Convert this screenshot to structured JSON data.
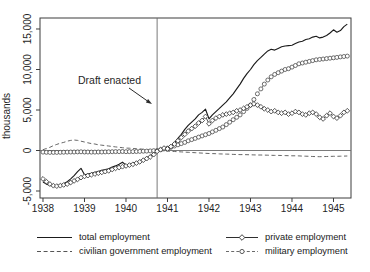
{
  "chart_data": {
    "type": "line",
    "title": "",
    "ylabel": "thousands",
    "xlabel": "",
    "frequency": "monthly",
    "x_start": 1938.0,
    "x_end": 1945.333,
    "x_ticks": [
      "1938",
      "1939",
      "1940",
      "1941",
      "1942",
      "1943",
      "1944",
      "1945"
    ],
    "x_tick_values": [
      1938,
      1939,
      1940,
      1941,
      1942,
      1943,
      1944,
      1945
    ],
    "y_ticks": [
      -5000,
      0,
      5000,
      10000,
      15000
    ],
    "y_tick_labels": [
      "-5,000",
      "0",
      "5,000",
      "10,000",
      "15,000"
    ],
    "xlim": [
      1937.928,
      1945.422
    ],
    "ylim": [
      -5864,
      16358
    ],
    "grid": "off",
    "zero_line_y": 0,
    "ref_line_x": 1940.75,
    "annotation": {
      "text": "Draft enacted",
      "points_to": "vertical reference line at draft enactment (late 1940)",
      "arrow_tip_x": 1940.63,
      "arrow_tip_y": 5740
    },
    "legend_position": "bottom, two columns",
    "series": [
      {
        "name": "total employment",
        "line": "solid",
        "marker": "none",
        "color": "#1b1b1b",
        "values": [
          -3900,
          -4150,
          -4300,
          -4400,
          -4350,
          -4250,
          -4100,
          -3850,
          -3500,
          -3100,
          -2600,
          -2200,
          -3000,
          -2900,
          -2800,
          -2700,
          -2600,
          -2450,
          -2350,
          -2250,
          -2050,
          -1900,
          -1700,
          -1450,
          -1800,
          -1700,
          -1600,
          -1450,
          -1300,
          -1100,
          -900,
          -650,
          -350,
          0,
          150,
          400,
          200,
          500,
          900,
          1500,
          2000,
          2600,
          3100,
          3500,
          3900,
          4400,
          4700,
          5100,
          3900,
          4400,
          4800,
          5200,
          5600,
          6000,
          6500,
          7000,
          7600,
          8200,
          8900,
          9500,
          10000,
          10600,
          11100,
          11500,
          11900,
          12300,
          12500,
          12400,
          12600,
          12800,
          12900,
          12950,
          13000,
          13200,
          13400,
          13500,
          13700,
          13800,
          14000,
          14100,
          13900,
          14000,
          14200,
          14500,
          14900,
          14600,
          14800,
          15300,
          15600
        ]
      },
      {
        "name": "civilian government employment",
        "line": "dashed",
        "marker": "none",
        "color": "#555555",
        "values": [
          100,
          250,
          400,
          600,
          750,
          900,
          1000,
          1150,
          1250,
          1300,
          1250,
          1150,
          1050,
          950,
          850,
          800,
          700,
          650,
          600,
          550,
          500,
          450,
          400,
          350,
          300,
          280,
          250,
          220,
          200,
          150,
          100,
          50,
          0,
          0,
          -30,
          -50,
          -80,
          -100,
          -120,
          -150,
          -170,
          -200,
          -220,
          -250,
          -270,
          -300,
          -320,
          -350,
          -370,
          -380,
          -400,
          -420,
          -430,
          -450,
          -460,
          -480,
          -490,
          -500,
          -510,
          -520,
          -530,
          -540,
          -550,
          -560,
          -570,
          -580,
          -590,
          -600,
          -610,
          -620,
          -630,
          -640,
          -650,
          -660,
          -670,
          -690,
          -700,
          -720,
          -740,
          -750,
          -760,
          -750,
          -740,
          -730,
          -720,
          -710,
          -700,
          -690,
          -680
        ]
      },
      {
        "name": "private employment",
        "line": "solid",
        "marker": "diamond",
        "color": "#2f2f2f",
        "values": [
          -3500,
          -3850,
          -4150,
          -4350,
          -4400,
          -4350,
          -4250,
          -4150,
          -3950,
          -3750,
          -3550,
          -3350,
          -3200,
          -3100,
          -3000,
          -2900,
          -2800,
          -2700,
          -2600,
          -2500,
          -2350,
          -2200,
          -2100,
          -2000,
          -1900,
          -1800,
          -1700,
          -1550,
          -1400,
          -1200,
          -1000,
          -800,
          -500,
          -100,
          100,
          300,
          200,
          500,
          800,
          1200,
          1600,
          2000,
          2400,
          2700,
          3000,
          3400,
          3700,
          4200,
          3300,
          3700,
          4000,
          4200,
          4400,
          4500,
          4600,
          4700,
          4900,
          5000,
          5200,
          5400,
          5600,
          5750,
          5600,
          5400,
          5150,
          5000,
          4800,
          4900,
          4700,
          4600,
          4700,
          4500,
          4600,
          4800,
          4700,
          4500,
          4400,
          4600,
          4700,
          4500,
          4100,
          3900,
          4300,
          4600,
          4200,
          4000,
          4300,
          4700,
          4900
        ]
      },
      {
        "name": "military employment",
        "line": "dashed",
        "marker": "circle",
        "color": "#4a4a4a",
        "values": [
          -200,
          -220,
          -230,
          -240,
          -230,
          -220,
          -210,
          -200,
          -190,
          -180,
          -170,
          -160,
          -180,
          -190,
          -200,
          -200,
          -190,
          -180,
          -170,
          -160,
          -150,
          -140,
          -130,
          -120,
          -150,
          -140,
          -130,
          -120,
          -110,
          -90,
          -70,
          -50,
          -20,
          0,
          100,
          200,
          300,
          400,
          550,
          700,
          850,
          1000,
          1200,
          1350,
          1500,
          1650,
          1800,
          1950,
          2100,
          2300,
          2500,
          2700,
          2900,
          3200,
          3500,
          3800,
          4100,
          4400,
          4800,
          5200,
          5600,
          6300,
          7000,
          7600,
          8200,
          8700,
          9100,
          9400,
          9600,
          9800,
          10000,
          10100,
          10300,
          10500,
          10700,
          10800,
          10900,
          11000,
          11100,
          11200,
          11250,
          11300,
          11350,
          11400,
          11450,
          11500,
          11550,
          11600,
          11650
        ]
      }
    ]
  },
  "colors": {
    "background": "#ffffff",
    "axis": "#3c3c3c",
    "reference_lines": "#6b6b6b",
    "text": "#1f1f1f"
  }
}
